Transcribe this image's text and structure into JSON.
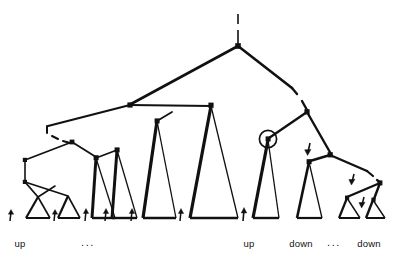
{
  "figure": {
    "name": "derivation-tree-diagram",
    "background_color": "#ffffff",
    "stroke_color": "#111111",
    "labels": [
      {
        "id": "up-left",
        "text": "up",
        "x": 20,
        "y": 247
      },
      {
        "id": "ellipsis-1",
        "text": "...",
        "x": 85,
        "y": 246
      },
      {
        "id": "up-right",
        "text": "up",
        "x": 245,
        "y": 247
      },
      {
        "id": "down-left",
        "text": "down",
        "x": 290,
        "y": 247
      },
      {
        "id": "ellipsis-2",
        "text": "...",
        "x": 332,
        "y": 246
      },
      {
        "id": "down-right",
        "text": "down",
        "x": 357,
        "y": 247
      }
    ],
    "arrows_up": [
      {
        "id": "arrow-up-1",
        "x": 10,
        "y": 221
      },
      {
        "id": "arrow-up-2",
        "x": 52,
        "y": 221
      },
      {
        "id": "arrow-up-3",
        "x": 88,
        "y": 221
      },
      {
        "id": "arrow-up-4",
        "x": 123,
        "y": 221
      },
      {
        "id": "arrow-up-5",
        "x": 160,
        "y": 221
      },
      {
        "id": "arrow-up-6",
        "x": 231,
        "y": 221
      }
    ],
    "arrows_down": [
      {
        "id": "arrow-down-1",
        "x": 309,
        "y": 147
      },
      {
        "id": "arrow-down-2",
        "x": 352,
        "y": 180
      },
      {
        "id": "arrow-down-3",
        "x": 363,
        "y": 206
      }
    ],
    "circled_node": {
      "id": "circled-node",
      "cx": 268,
      "cy": 139,
      "r": 9
    },
    "dashed_segments": [
      {
        "id": "dashed-root-stem",
        "x1": 238,
        "y1": 15,
        "x2": 238,
        "y2": 45
      },
      {
        "id": "dashed-left-edge",
        "x1": 46,
        "y1": 127,
        "x2": 68,
        "y2": 143
      },
      {
        "id": "dashed-right-edge",
        "x1": 294,
        "y1": 92,
        "x2": 307,
        "y2": 110
      },
      {
        "id": "dashed-lower-right",
        "x1": 366,
        "y1": 172,
        "x2": 380,
        "y2": 182
      }
    ],
    "nodes": [
      {
        "id": "root",
        "x": 238,
        "y": 46
      },
      {
        "id": "node-L",
        "x": 130,
        "y": 105
      },
      {
        "id": "node-R",
        "x": 307,
        "y": 112
      },
      {
        "id": "node-LL",
        "x": 72,
        "y": 142
      },
      {
        "id": "node-LR",
        "x": 211,
        "y": 105
      },
      {
        "id": "node-RL",
        "x": 268,
        "y": 139
      },
      {
        "id": "node-RR",
        "x": 330,
        "y": 155
      },
      {
        "id": "node-RRL",
        "x": 309,
        "y": 162
      },
      {
        "id": "node-RRR",
        "x": 380,
        "y": 183
      }
    ],
    "triangles": [
      {
        "id": "subtree-tri-1",
        "apex_x": 38,
        "apex_y": 197,
        "left_x": 26,
        "right_x": 50,
        "base_y": 218
      },
      {
        "id": "subtree-tri-2",
        "apex_x": 68,
        "apex_y": 197,
        "left_x": 58,
        "right_x": 80,
        "base_y": 218
      },
      {
        "id": "subtree-tri-3",
        "apex_x": 96,
        "apex_y": 158,
        "left_x": 92,
        "right_x": 115,
        "base_y": 218
      },
      {
        "id": "subtree-tri-4",
        "apex_x": 117,
        "apex_y": 150,
        "left_x": 112,
        "right_x": 137,
        "base_y": 218
      },
      {
        "id": "subtree-tri-5",
        "apex_x": 157,
        "apex_y": 120,
        "left_x": 143,
        "right_x": 176,
        "base_y": 218
      },
      {
        "id": "subtree-tri-6",
        "apex_x": 211,
        "apex_y": 105,
        "left_x": 190,
        "right_x": 238,
        "base_y": 218
      },
      {
        "id": "subtree-tri-7",
        "apex_x": 268,
        "apex_y": 139,
        "left_x": 253,
        "right_x": 279,
        "base_y": 218
      },
      {
        "id": "subtree-tri-8",
        "apex_x": 309,
        "apex_y": 162,
        "left_x": 297,
        "right_x": 322,
        "base_y": 218
      },
      {
        "id": "subtree-tri-9",
        "apex_x": 347,
        "apex_y": 198,
        "left_x": 339,
        "right_x": 360,
        "base_y": 218
      },
      {
        "id": "subtree-tri-10",
        "apex_x": 373,
        "apex_y": 200,
        "left_x": 366,
        "right_x": 385,
        "base_y": 218
      }
    ]
  }
}
